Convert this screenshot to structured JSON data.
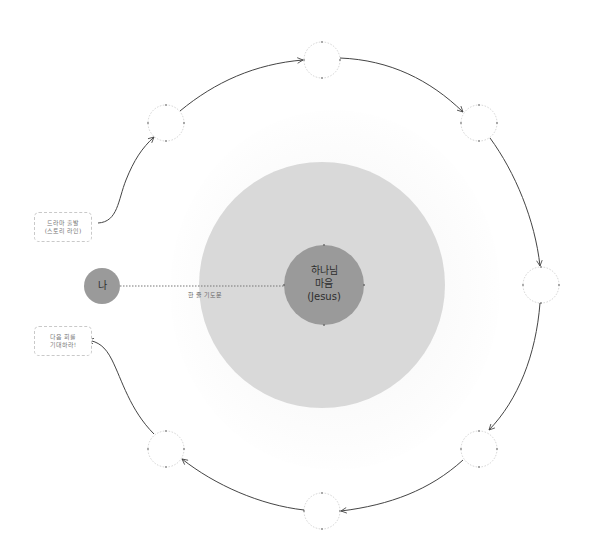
{
  "diagram": {
    "center": {
      "line1": "하나님",
      "line2": "마음",
      "line3": "(Jesus)",
      "inner_color": "#9a9a9a",
      "outer_color": "#d9d9d9"
    },
    "self_node": {
      "label": "나",
      "color": "#9a9a9a"
    },
    "connector": {
      "label": "한 줄 기도문",
      "style": "dotted"
    },
    "start_box": {
      "line1": "드라마 출발",
      "line2": "(스토리 라인)"
    },
    "end_box": {
      "line1": "다음 회를",
      "line2": "기대하라!"
    },
    "cycle_nodes": [
      {
        "id": "top-left",
        "label": ""
      },
      {
        "id": "top",
        "label": ""
      },
      {
        "id": "top-right",
        "label": ""
      },
      {
        "id": "right",
        "label": ""
      },
      {
        "id": "bottom-right",
        "label": ""
      },
      {
        "id": "bottom",
        "label": ""
      },
      {
        "id": "bottom-left",
        "label": ""
      }
    ],
    "cycle_direction": "clockwise",
    "arrow_color": "#444444"
  }
}
